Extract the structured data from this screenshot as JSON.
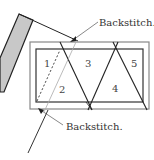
{
  "diagram": {
    "type": "sewing-instruction",
    "labels": {
      "top_callout": "Backstitch.",
      "bottom_callout": "Backstitch."
    },
    "sections": [
      {
        "id": 1,
        "label": "1"
      },
      {
        "id": 2,
        "label": "2"
      },
      {
        "id": 3,
        "label": "3"
      },
      {
        "id": 4,
        "label": "4"
      },
      {
        "id": 5,
        "label": "5"
      }
    ],
    "colors": {
      "line": "#222222",
      "bar_fill": "#c8c8c8",
      "border": "#777777",
      "background": "#ffffff"
    }
  }
}
